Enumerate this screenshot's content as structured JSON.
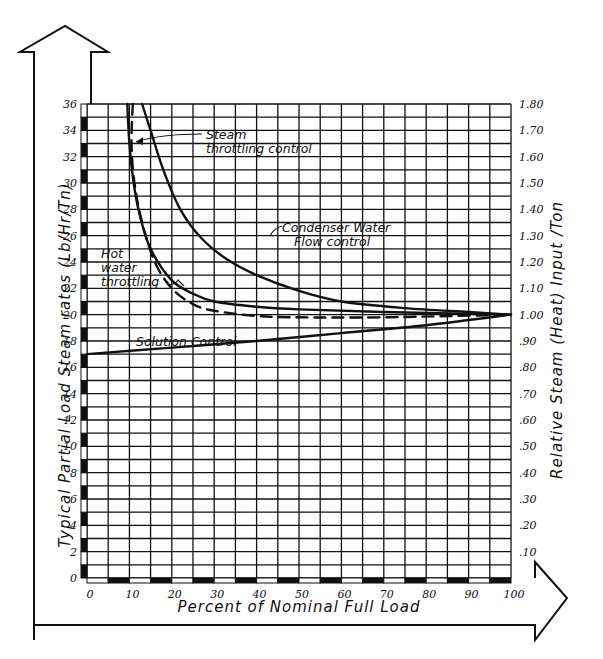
{
  "chart_data": {
    "type": "line",
    "title": "",
    "xlabel": "Percent of Nominal Full Load",
    "ylabel": "Typical Partial Load Steam rates (Lb/Hr/Tn)",
    "y2label": "Relative Steam (Heat) Input /Ton",
    "xlim": [
      0,
      100
    ],
    "ylim": [
      0,
      36
    ],
    "y2lim": [
      0,
      1.8
    ],
    "grid": true,
    "x_ticks": [
      "0",
      "10",
      "20",
      "30",
      "40",
      "50",
      "60",
      "70",
      "80",
      "90",
      "100"
    ],
    "x_tick_values": [
      0,
      10,
      20,
      30,
      40,
      50,
      60,
      70,
      80,
      90,
      100
    ],
    "y_ticks": [
      "0",
      "2",
      "4",
      "6",
      "8",
      "10",
      "12",
      "14",
      "16",
      "18",
      "20",
      "22",
      "24",
      "26",
      "28",
      "30",
      "32",
      "34",
      "36"
    ],
    "y_tick_values": [
      0,
      2,
      4,
      6,
      8,
      10,
      12,
      14,
      16,
      18,
      20,
      22,
      24,
      26,
      28,
      30,
      32,
      34,
      36
    ],
    "y2_ticks": [
      ".10",
      ".20",
      ".30",
      ".40",
      ".50",
      ".60",
      ".70",
      ".80",
      ".90",
      "1.00",
      "1.10",
      "1.20",
      "1.30",
      "1.40",
      "1.50",
      "1.60",
      "1.70",
      "1.80"
    ],
    "y2_tick_values": [
      0.1,
      0.2,
      0.3,
      0.4,
      0.5,
      0.6,
      0.7,
      0.8,
      0.9,
      1.0,
      1.1,
      1.2,
      1.3,
      1.4,
      1.5,
      1.6,
      1.7,
      1.8
    ],
    "series": [
      {
        "name": "Steam throttling control",
        "style": "solid",
        "x": [
          9.5,
          10,
          11,
          12.5,
          15,
          20,
          25,
          30,
          40,
          50,
          70,
          100
        ],
        "y": [
          36,
          33,
          30,
          27.5,
          25,
          22.6,
          21.6,
          21,
          20.6,
          20.4,
          20.2,
          20
        ]
      },
      {
        "name": "Hot water throttling",
        "style": "dashed",
        "x": [
          10.8,
          10.5,
          11.2,
          13,
          16,
          20,
          25,
          30,
          40,
          50,
          70,
          100
        ],
        "y": [
          36,
          33,
          30,
          27,
          24,
          22,
          20.8,
          20.3,
          19.9,
          19.8,
          19.8,
          20
        ]
      },
      {
        "name": "Condenser Water Flow control",
        "style": "solid",
        "x": [
          13,
          15,
          18,
          22,
          27,
          33,
          40,
          50,
          60,
          75,
          90,
          100
        ],
        "y": [
          36,
          34,
          31,
          28,
          25.8,
          24.2,
          23,
          21.8,
          21,
          20.5,
          20.2,
          20
        ]
      },
      {
        "name": "Solution Control",
        "style": "solid",
        "x": [
          0,
          20,
          40,
          60,
          80,
          100
        ],
        "y": [
          17,
          17.5,
          18,
          18.6,
          19.2,
          20
        ]
      }
    ],
    "annotations": [
      {
        "text_lines": [
          "Steam",
          "throttling control"
        ],
        "points_to": "Steam throttling control"
      },
      {
        "text_lines": [
          "Condenser Water",
          "Flow control"
        ],
        "points_to": "Condenser Water Flow control"
      },
      {
        "text_lines": [
          "Hot",
          "water",
          "throttling"
        ],
        "points_to": "Hot water throttling"
      },
      {
        "text_lines": [
          "Solution Control"
        ],
        "points_to": "Solution Control"
      }
    ]
  }
}
